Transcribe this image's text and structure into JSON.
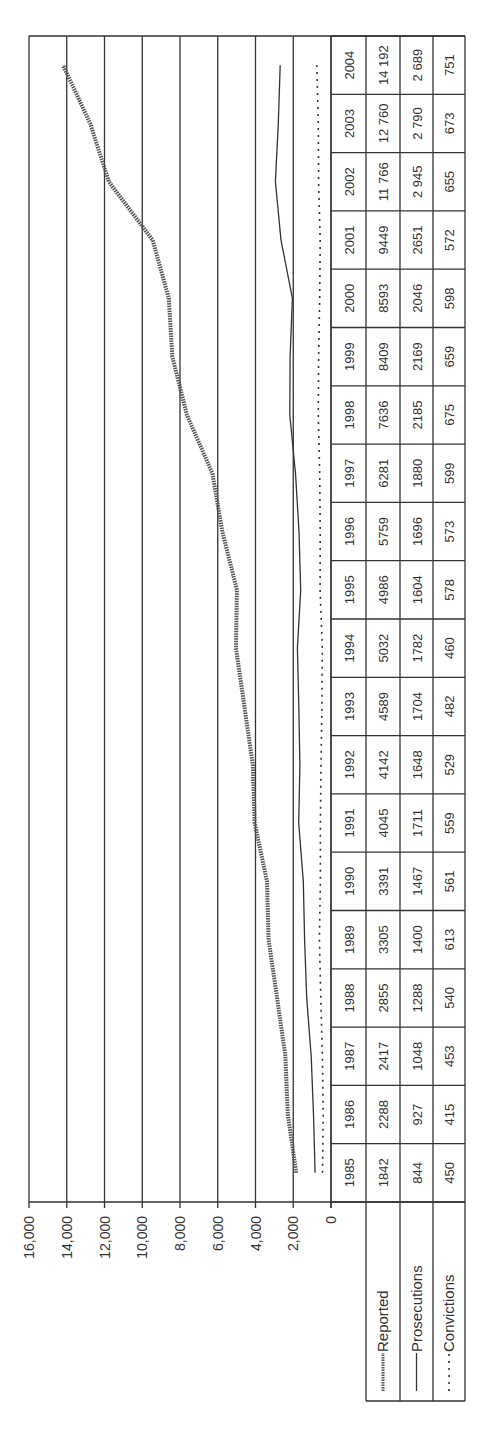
{
  "chart_data": {
    "type": "line",
    "title": "",
    "orientation": "rotated-90-ccw",
    "xlabel": "",
    "ylabel": "",
    "ylim": [
      0,
      16000
    ],
    "y_ticks": [
      "0",
      "2,000",
      "4,000",
      "6,000",
      "8,000",
      "10,000",
      "12,000",
      "14,000",
      "16,000"
    ],
    "y_tick_values": [
      0,
      2000,
      4000,
      6000,
      8000,
      10000,
      12000,
      14000,
      16000
    ],
    "grid": true,
    "legend_position": "data-table",
    "categories": [
      "1985",
      "1986",
      "1987",
      "1988",
      "1989",
      "1990",
      "1991",
      "1992",
      "1993",
      "1994",
      "1995",
      "1996",
      "1997",
      "1998",
      "1999",
      "2000",
      "2001",
      "2002",
      "2003",
      "2004"
    ],
    "series": [
      {
        "name": "Reported",
        "style": "thick-textured",
        "values": [
          1842,
          2288,
          2417,
          2855,
          3305,
          3391,
          4045,
          4142,
          4589,
          5032,
          4986,
          5759,
          6281,
          7636,
          8409,
          8593,
          9449,
          11766,
          12760,
          14192
        ],
        "labels": [
          "1842",
          "2288",
          "2417",
          "2855",
          "3305",
          "3391",
          "4045",
          "4142",
          "4589",
          "5032",
          "4986",
          "5759",
          "6281",
          "7636",
          "8409",
          "8593",
          "9449",
          "11 766",
          "12 760",
          "14 192"
        ]
      },
      {
        "name": "Prosecutions",
        "style": "solid",
        "values": [
          844,
          927,
          1048,
          1288,
          1400,
          1467,
          1711,
          1648,
          1704,
          1782,
          1604,
          1696,
          1880,
          2185,
          2169,
          2046,
          2651,
          2945,
          2790,
          2689
        ],
        "labels": [
          "844",
          "927",
          "1048",
          "1288",
          "1400",
          "1467",
          "1711",
          "1648",
          "1704",
          "1782",
          "1604",
          "1696",
          "1880",
          "2185",
          "2169",
          "2046",
          "2651",
          "2 945",
          "2 790",
          "2 689"
        ]
      },
      {
        "name": "Convictions",
        "style": "dotted",
        "values": [
          450,
          415,
          453,
          540,
          613,
          561,
          559,
          529,
          482,
          460,
          578,
          573,
          599,
          675,
          659,
          598,
          572,
          655,
          673,
          751
        ],
        "labels": [
          "450",
          "415",
          "453",
          "540",
          "613",
          "561",
          "559",
          "529",
          "482",
          "460",
          "578",
          "573",
          "599",
          "675",
          "659",
          "598",
          "572",
          "655",
          "673",
          "751"
        ]
      }
    ]
  }
}
